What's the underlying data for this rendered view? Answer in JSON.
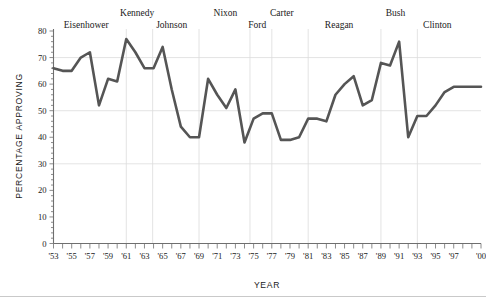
{
  "chart_data": {
    "type": "line",
    "title": "",
    "xlabel": "YEAR",
    "ylabel": "PERCENTAGE APPROVING",
    "ylim": [
      0,
      80
    ],
    "ytick_step": 10,
    "yticks": [
      "0",
      "10",
      "20",
      "30",
      "40",
      "50",
      "60",
      "70",
      "80"
    ],
    "xlim": [
      1953,
      2000
    ],
    "xticks": [
      "'53",
      "'55",
      "'57",
      "'59",
      "'61",
      "'63",
      "'65",
      "'67",
      "'69",
      "'71",
      "'73",
      "'75",
      "'77",
      "'79",
      "'81",
      "'83",
      "'85",
      "'87",
      "'89",
      "'91",
      "'93",
      "'95",
      "'97",
      "'00"
    ],
    "xtick_values": [
      1953,
      1955,
      1957,
      1959,
      1961,
      1963,
      1965,
      1967,
      1969,
      1971,
      1973,
      1975,
      1977,
      1979,
      1981,
      1983,
      1985,
      1987,
      1989,
      1991,
      1993,
      1995,
      1997,
      2000
    ],
    "minor_tick_years": [
      1954,
      1956,
      1958,
      1960,
      1962,
      1964,
      1966,
      1968,
      1970,
      1972,
      1974,
      1976,
      1978,
      1980,
      1982,
      1984,
      1986,
      1988,
      1990,
      1992,
      1994,
      1996,
      1998,
      1999
    ],
    "grid": "horizontal-major",
    "legend": "none",
    "line_color": "#555555",
    "x": [
      1953,
      1954,
      1955,
      1956,
      1957,
      1958,
      1959,
      1960,
      1961,
      1962,
      1963,
      1964,
      1965,
      1966,
      1967,
      1968,
      1969,
      1970,
      1971,
      1972,
      1973,
      1974,
      1975,
      1976,
      1977,
      1978,
      1979,
      1980,
      1981,
      1982,
      1983,
      1984,
      1985,
      1986,
      1987,
      1988,
      1989,
      1990,
      1991,
      1992,
      1993,
      1994,
      1995,
      1996,
      1997,
      1998,
      1999,
      2000
    ],
    "values": [
      66,
      65,
      65,
      70,
      72,
      52,
      62,
      61,
      77,
      72,
      66,
      66,
      74,
      58,
      44,
      40,
      40,
      62,
      56,
      51,
      58,
      38,
      47,
      49,
      49,
      39,
      39,
      40,
      47,
      47,
      46,
      56,
      60,
      63,
      52,
      54,
      68,
      67,
      76,
      40,
      48,
      48,
      52,
      57,
      59,
      59,
      59,
      59
    ],
    "presidents": [
      {
        "name": "Eisenhower",
        "start": 1953,
        "end": 1961,
        "label_x": 1956.6,
        "label_row": 1
      },
      {
        "name": "Kennedy",
        "start": 1961,
        "end": 1963.9,
        "label_x": 1962.2,
        "label_row": 0
      },
      {
        "name": "Johnson",
        "start": 1963.9,
        "end": 1969,
        "label_x": 1966.0,
        "label_row": 1
      },
      {
        "name": "Nixon",
        "start": 1969,
        "end": 1974.6,
        "label_x": 1971.9,
        "label_row": 0
      },
      {
        "name": "Ford",
        "start": 1974.6,
        "end": 1977,
        "label_x": 1975.4,
        "label_row": 1
      },
      {
        "name": "Carter",
        "start": 1977,
        "end": 1981,
        "label_x": 1978.1,
        "label_row": 0
      },
      {
        "name": "Reagan",
        "start": 1981,
        "end": 1989,
        "label_x": 1984.4,
        "label_row": 1
      },
      {
        "name": "Bush",
        "start": 1989,
        "end": 1993,
        "label_x": 1990.6,
        "label_row": 0
      },
      {
        "name": "Clinton",
        "start": 1993,
        "end": 2000,
        "label_x": 1995.2,
        "label_row": 1
      }
    ]
  }
}
